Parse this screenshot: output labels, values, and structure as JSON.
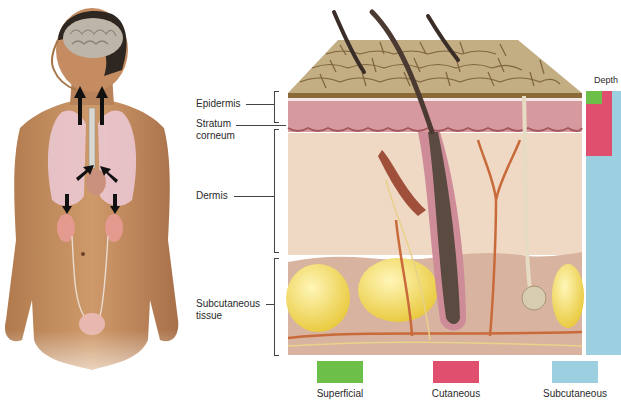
{
  "figure": {
    "left_panel": {
      "subject": "human body with brain, lungs, heart, kidneys and bladder",
      "arrows": 6
    },
    "skin_section": {
      "labels": [
        {
          "key": "epidermis",
          "text": "Epidermis"
        },
        {
          "key": "stratum",
          "line1": "Stratum",
          "line2": "corneum"
        },
        {
          "key": "dermis",
          "text": "Dermis"
        },
        {
          "key": "subcutaneous",
          "line1": "Subcutaneous",
          "line2": "tissue"
        }
      ]
    },
    "depth_bar": {
      "title": "Depth",
      "segments": [
        {
          "name": "Superficial",
          "color": "#6cc04a"
        },
        {
          "name": "Cutaneous",
          "color": "#e0506e"
        },
        {
          "name": "Subcutaneous",
          "color": "#9cd0e0"
        }
      ]
    },
    "legend": [
      {
        "label": "Superficial",
        "color": "#6cc04a"
      },
      {
        "label": "Cutaneous",
        "color": "#e0506e"
      },
      {
        "label": "Subcutaneous",
        "color": "#9cd0e0"
      }
    ]
  }
}
